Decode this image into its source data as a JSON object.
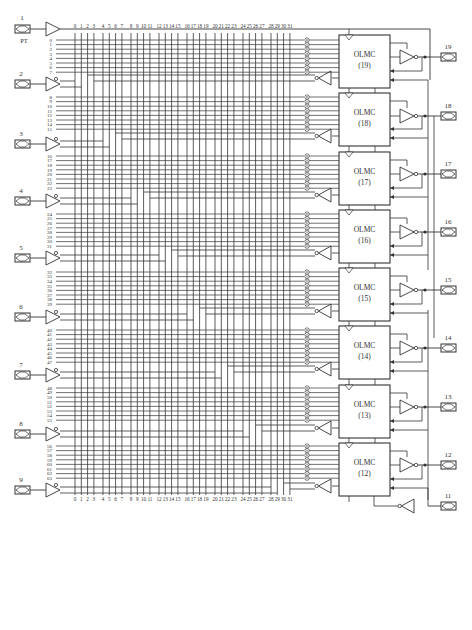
{
  "diagram": {
    "column_labels": [
      "0",
      "1",
      "2",
      "3",
      "4",
      "5",
      "6",
      "7",
      "8",
      "9",
      "10",
      "11",
      "12",
      "13",
      "14",
      "15",
      "16",
      "17",
      "18",
      "19",
      "20",
      "21",
      "22",
      "23",
      "24",
      "25",
      "26",
      "27",
      "28",
      "29",
      "30",
      "31"
    ],
    "clock_pin": {
      "number": "1",
      "label": "PT"
    },
    "input_pins": [
      {
        "number": "2",
        "rows": [
          "8",
          "9",
          "10",
          "11",
          "12",
          "13",
          "14",
          "15"
        ]
      },
      {
        "number": "3",
        "rows": [
          "16",
          "17",
          "18",
          "19",
          "20",
          "21",
          "22",
          "23"
        ]
      },
      {
        "number": "4",
        "rows": [
          "24",
          "25",
          "26",
          "27",
          "28",
          "29",
          "30",
          "31"
        ]
      },
      {
        "number": "5",
        "rows": [
          "32",
          "33",
          "34",
          "35",
          "36",
          "37",
          "38",
          "39"
        ]
      },
      {
        "number": "6",
        "rows": [
          "40",
          "41",
          "42",
          "43",
          "44",
          "45",
          "46",
          "47"
        ]
      },
      {
        "number": "7",
        "rows": [
          "48",
          "49",
          "50",
          "51",
          "52",
          "53",
          "54",
          "55"
        ]
      },
      {
        "number": "8",
        "rows": [
          "56",
          "57",
          "58",
          "59",
          "60",
          "61",
          "62",
          "63"
        ]
      },
      {
        "number": "9",
        "rows": []
      }
    ],
    "first_rows": [
      "0",
      "1",
      "2",
      "3",
      "4",
      "5",
      "6",
      "7"
    ],
    "olmc_label": "OLMC",
    "olmcs": [
      {
        "id": "(19)",
        "pin": "19"
      },
      {
        "id": "(18)",
        "pin": "18"
      },
      {
        "id": "(17)",
        "pin": "17"
      },
      {
        "id": "(16)",
        "pin": "16"
      },
      {
        "id": "(15)",
        "pin": "15"
      },
      {
        "id": "(14)",
        "pin": "14"
      },
      {
        "id": "(13)",
        "pin": "13"
      },
      {
        "id": "(12)",
        "pin": "12"
      }
    ],
    "oe_pin": {
      "number": "11"
    },
    "colors": {
      "line": "#333333",
      "background": "#ffffff"
    }
  }
}
